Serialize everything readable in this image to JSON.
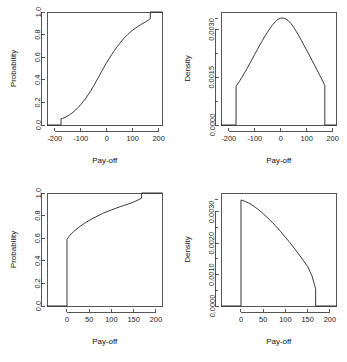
{
  "figure": {
    "layout": "2x2-grid",
    "background": "#ffffff",
    "line_color": "#232323",
    "panel_count": 4
  },
  "chart_data": [
    {
      "id": "top-left",
      "type": "line",
      "title": "",
      "xlabel": "Pay-off",
      "ylabel": "Probability",
      "xlim": [
        -230,
        215
      ],
      "ylim": [
        0,
        1
      ],
      "xticks": [
        -200,
        -100,
        0,
        100,
        200
      ],
      "xticklabels": [
        "-200",
        "-100",
        "0",
        "100",
        "200"
      ],
      "yticks": [
        0,
        0.2,
        0.4,
        0.6,
        0.8,
        1
      ],
      "yticklabels": [
        "0.0",
        "0.2",
        "0.4",
        "0.6",
        "0.8",
        "1.0"
      ],
      "grid": false,
      "legend": "none",
      "description": "Cumulative distribution function with probability mass jumps at both tails",
      "x": [
        -230,
        -176,
        -176,
        -170,
        -160,
        -150,
        -140,
        -130,
        -120,
        -110,
        -100,
        -90,
        -80,
        -70,
        -60,
        -50,
        -40,
        -30,
        -20,
        -10,
        0,
        10,
        20,
        30,
        40,
        50,
        60,
        70,
        80,
        90,
        100,
        110,
        120,
        130,
        140,
        150,
        160,
        168,
        168,
        215
      ],
      "y": [
        0,
        0,
        0.055,
        0.058,
        0.068,
        0.08,
        0.095,
        0.112,
        0.132,
        0.155,
        0.18,
        0.208,
        0.238,
        0.272,
        0.308,
        0.347,
        0.388,
        0.43,
        0.472,
        0.513,
        0.553,
        0.59,
        0.626,
        0.66,
        0.692,
        0.722,
        0.75,
        0.776,
        0.799,
        0.82,
        0.839,
        0.856,
        0.872,
        0.886,
        0.9,
        0.913,
        0.928,
        0.94,
        1.0,
        1.0
      ]
    },
    {
      "id": "top-right",
      "type": "line",
      "title": "",
      "xlabel": "Pay-off",
      "ylabel": "Density",
      "xlim": [
        -230,
        215
      ],
      "ylim": [
        0,
        0.00355
      ],
      "xticks": [
        -200,
        -100,
        0,
        100,
        200
      ],
      "xticklabels": [
        "-200",
        "-100",
        "0",
        "100",
        "200"
      ],
      "yticks": [
        0,
        0.0015,
        0.003
      ],
      "yticklabels": [
        "0.0000",
        "0.0015",
        "0.0030"
      ],
      "minor_yticks": [
        0.00075,
        0.00225,
        0.00335
      ],
      "grid": false,
      "legend": "none",
      "description": "Bell-shaped truncated density, zero outside plus/minus 172, vertical edges at the truncation points",
      "x": [
        -230,
        -172,
        -172,
        -160,
        -150,
        -140,
        -130,
        -120,
        -110,
        -100,
        -90,
        -80,
        -70,
        -60,
        -50,
        -40,
        -30,
        -20,
        -10,
        0,
        10,
        20,
        30,
        40,
        50,
        60,
        70,
        80,
        90,
        100,
        110,
        120,
        130,
        140,
        150,
        160,
        170,
        170,
        215
      ],
      "y": [
        0,
        0,
        0.00121,
        0.00136,
        0.00149,
        0.00163,
        0.00177,
        0.00192,
        0.00207,
        0.00222,
        0.00237,
        0.00252,
        0.00266,
        0.0028,
        0.00293,
        0.00305,
        0.00316,
        0.00325,
        0.00332,
        0.00336,
        0.00336,
        0.00333,
        0.00327,
        0.00318,
        0.00307,
        0.00294,
        0.0028,
        0.00265,
        0.0025,
        0.00235,
        0.0022,
        0.00204,
        0.00189,
        0.00173,
        0.00157,
        0.00141,
        0.00124,
        0,
        0
      ]
    },
    {
      "id": "bottom-left",
      "type": "line",
      "title": "",
      "xlabel": "Pay-off",
      "ylabel": "Probability",
      "xlim": [
        -45,
        215
      ],
      "ylim": [
        0,
        1
      ],
      "xticks": [
        0,
        50,
        100,
        150,
        200
      ],
      "xticklabels": [
        "0",
        "50",
        "100",
        "150",
        "200"
      ],
      "yticks": [
        0,
        0.2,
        0.4,
        0.6,
        0.8,
        1
      ],
      "yticklabels": [
        "0.0",
        "0.2",
        "0.4",
        "0.6",
        "0.8",
        "1.0"
      ],
      "grid": false,
      "legend": "none",
      "description": "Cumulative distribution with a large atom at zero jumping to 0.59, concave rise, final jump to one near 170",
      "x": [
        -45,
        0,
        0,
        5,
        10,
        15,
        20,
        30,
        40,
        50,
        60,
        70,
        80,
        90,
        100,
        110,
        120,
        130,
        140,
        150,
        160,
        168,
        168,
        215
      ],
      "y": [
        0,
        0,
        0.59,
        0.618,
        0.64,
        0.659,
        0.676,
        0.706,
        0.733,
        0.757,
        0.779,
        0.799,
        0.818,
        0.835,
        0.85,
        0.865,
        0.879,
        0.892,
        0.905,
        0.92,
        0.938,
        0.955,
        1.0,
        1.0
      ]
    },
    {
      "id": "bottom-right",
      "type": "line",
      "title": "",
      "xlabel": "Pay-off",
      "ylabel": "Density",
      "xlim": [
        -45,
        215
      ],
      "ylim": [
        0,
        0.0036
      ],
      "xticks": [
        0,
        50,
        100,
        150,
        200
      ],
      "xticklabels": [
        "0",
        "50",
        "100",
        "150",
        "200"
      ],
      "yticks": [
        0,
        0.001,
        0.002,
        0.003
      ],
      "yticklabels": [
        "0.0000",
        "0.0010",
        "0.0020",
        "0.0030"
      ],
      "minor_yticks": [
        0.0005,
        0.0015,
        0.0025,
        0.0034
      ],
      "grid": false,
      "legend": "none",
      "description": "Monotonically decreasing density from 0.0034 at zero to 0.0005 at 170, zero elsewhere",
      "x": [
        -45,
        0,
        0,
        10,
        20,
        30,
        40,
        50,
        60,
        70,
        80,
        90,
        100,
        110,
        120,
        130,
        140,
        150,
        160,
        168,
        168,
        215
      ],
      "y": [
        0,
        0,
        0.00338,
        0.00333,
        0.00326,
        0.00317,
        0.00306,
        0.00294,
        0.00281,
        0.00267,
        0.00252,
        0.00236,
        0.00219,
        0.00202,
        0.00184,
        0.00165,
        0.00146,
        0.00126,
        0.00095,
        0.00055,
        0,
        0
      ]
    }
  ]
}
